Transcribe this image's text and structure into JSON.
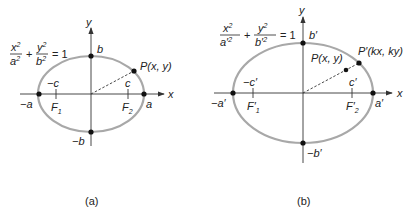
{
  "figure_a": {
    "caption": "(a)",
    "equation": {
      "num1": "x",
      "den1": "a",
      "plus": "+",
      "num2": "y",
      "den2": "b",
      "equals": "= 1",
      "exp": "2"
    },
    "axis_labels": {
      "x": "x",
      "y": "y"
    },
    "points": {
      "b": "b",
      "neg_b": "−b",
      "a": "a",
      "neg_a": "−a",
      "P": "P(x, y)"
    },
    "foci": {
      "c": "c",
      "neg_c": "−c",
      "F1": "F",
      "F1_sub": "1",
      "F2": "F",
      "F2_sub": "2"
    }
  },
  "figure_b": {
    "caption": "(b)",
    "equation": {
      "num1": "x",
      "den1": "a′",
      "plus": "+",
      "num2": "y",
      "den2": "b′",
      "equals": "= 1",
      "exp": "2"
    },
    "axis_labels": {
      "x": "x",
      "y": "y"
    },
    "points": {
      "b": "b′",
      "neg_b": "−b′",
      "a": "a′",
      "neg_a": "−a′",
      "P": "P(x, y)",
      "P_prime": "P′(kx, ky)"
    },
    "foci": {
      "c": "c′",
      "neg_c": "−c′",
      "F1": "F′",
      "F1_sub": "1",
      "F2": "F′",
      "F2_sub": "2"
    }
  },
  "colors": {
    "ellipse": "#a8a8a8",
    "axis": "#333333",
    "point": "#111111"
  }
}
